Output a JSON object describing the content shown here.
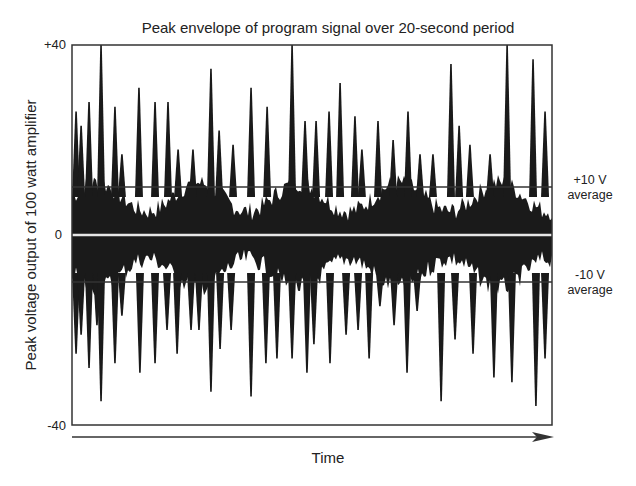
{
  "chart_data": {
    "type": "area",
    "title": "Peak envelope of program signal over 20-second period",
    "xlabel": "Time",
    "ylabel": "Peak voltage output of 100 watt amplifier",
    "ylim": [
      -40,
      40
    ],
    "xlim": [
      0,
      20
    ],
    "y_ticks": [
      "+40",
      "0",
      "-40"
    ],
    "grid": false,
    "reference_lines": [
      {
        "value": 10,
        "label_line1": "+10 V",
        "label_line2": "average"
      },
      {
        "value": -10,
        "label_line1": "-10 V",
        "label_line2": "average"
      }
    ],
    "series": [
      {
        "name": "positive peaks",
        "x_seconds": [
          0.17,
          0.38,
          0.71,
          1.21,
          1.79,
          2.08,
          2.79,
          3.46,
          4.0,
          4.42,
          5.04,
          5.79,
          6.13,
          6.71,
          7.46,
          8.13,
          9.17,
          9.71,
          10.17,
          10.71,
          11.17,
          11.79,
          12.08,
          12.75,
          13.38,
          14.0,
          14.5,
          15.04,
          15.79,
          16.13,
          16.58,
          17.42,
          18.13,
          19.21,
          19.71
        ],
        "values": [
          26,
          23,
          28,
          40,
          27,
          17,
          31,
          28,
          28,
          18,
          18,
          35,
          22,
          19,
          31,
          27,
          40,
          24,
          24,
          26,
          32,
          25,
          18,
          24,
          20,
          26,
          17,
          17,
          36,
          23,
          19,
          17,
          40,
          37,
          26
        ]
      },
      {
        "name": "negative peaks",
        "x_seconds": [
          0.17,
          0.38,
          0.71,
          1.04,
          1.21,
          1.79,
          2.08,
          2.83,
          3.46,
          3.96,
          4.38,
          4.96,
          5.29,
          5.79,
          6.17,
          6.63,
          7.46,
          8.08,
          8.54,
          9.17,
          9.79,
          10.08,
          10.75,
          11.42,
          11.92,
          12.38,
          12.83,
          13.42,
          13.96,
          14.38,
          15.38,
          15.96,
          16.71,
          17.58,
          18.33,
          19.33,
          19.71
        ],
        "values": [
          -25,
          -21,
          -28,
          -19,
          -35,
          -27,
          -17,
          -29,
          -27,
          -20,
          -25,
          -20,
          -20,
          -33,
          -24,
          -20,
          -34,
          -27,
          -26,
          -26,
          -29,
          -23,
          -27,
          -21,
          -20,
          -26,
          -15,
          -19,
          -29,
          -16,
          -35,
          -22,
          -25,
          -30,
          -31,
          -36,
          -26
        ]
      }
    ],
    "body_level": 6
  },
  "labels": {
    "title": "Peak envelope of program signal over 20-second period",
    "ylabel": "Peak voltage output of 100 watt amplifier",
    "xlabel": "Time",
    "tick_top": "+40",
    "tick_mid": "0",
    "tick_bot": "-40",
    "plus10_line1": "+10 V",
    "plus10_line2": "average",
    "minus10_line1": "-10 V",
    "minus10_line2": "average"
  },
  "colors": {
    "fill": "#1a1a1a",
    "frame": "#333333",
    "reference": "#333333",
    "zero_line": "#dddddd"
  }
}
